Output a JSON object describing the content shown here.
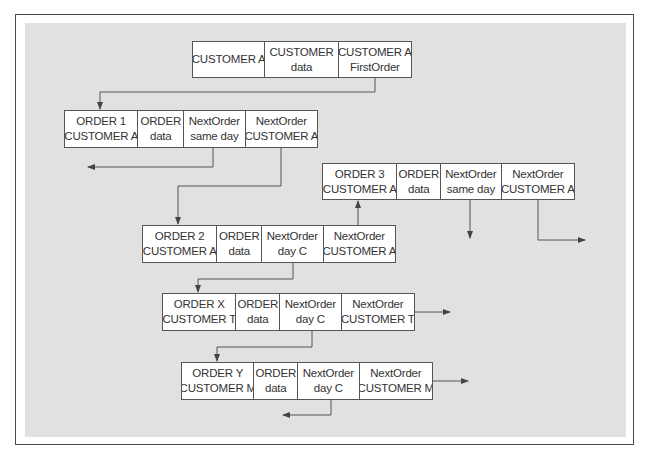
{
  "figure": {
    "type": "linked-list-diagram",
    "colors": {
      "frame": "#4a4a4a",
      "panel": "#e1e1e1",
      "box_fill": "#ffffff",
      "line": "#555555",
      "text": "#333333"
    }
  },
  "records": {
    "customer": {
      "fields": [
        {
          "line1": "CUSTOMER A",
          "line2": ""
        },
        {
          "line1": "CUSTOMER",
          "line2": "data"
        },
        {
          "line1": "CUSTOMER A",
          "line2": "FirstOrder"
        }
      ]
    },
    "order1": {
      "fields": [
        {
          "line1": "ORDER 1",
          "line2": "CUSTOMER A"
        },
        {
          "line1": "ORDER",
          "line2": "data"
        },
        {
          "line1": "NextOrder",
          "line2": "same day"
        },
        {
          "line1": "NextOrder",
          "line2": "CUSTOMER A"
        }
      ]
    },
    "order3": {
      "fields": [
        {
          "line1": "ORDER 3",
          "line2": "CUSTOMER A"
        },
        {
          "line1": "ORDER",
          "line2": "data"
        },
        {
          "line1": "NextOrder",
          "line2": "same day"
        },
        {
          "line1": "NextOrder",
          "line2": "CUSTOMER A"
        }
      ]
    },
    "order2": {
      "fields": [
        {
          "line1": "ORDER 2",
          "line2": "CUSTOMER A"
        },
        {
          "line1": "ORDER",
          "line2": "data"
        },
        {
          "line1": "NextOrder",
          "line2": "day C"
        },
        {
          "line1": "NextOrder",
          "line2": "CUSTOMER A"
        }
      ]
    },
    "orderX": {
      "fields": [
        {
          "line1": "ORDER X",
          "line2": "CUSTOMER T"
        },
        {
          "line1": "ORDER",
          "line2": "data"
        },
        {
          "line1": "NextOrder",
          "line2": "day C"
        },
        {
          "line1": "NextOrder",
          "line2": "CUSTOMER T"
        }
      ]
    },
    "orderY": {
      "fields": [
        {
          "line1": "ORDER Y",
          "line2": "CUSTOMER M"
        },
        {
          "line1": "ORDER",
          "line2": "data"
        },
        {
          "line1": "NextOrder",
          "line2": "day C"
        },
        {
          "line1": "NextOrder",
          "line2": "CUSTOMER M"
        }
      ]
    }
  }
}
